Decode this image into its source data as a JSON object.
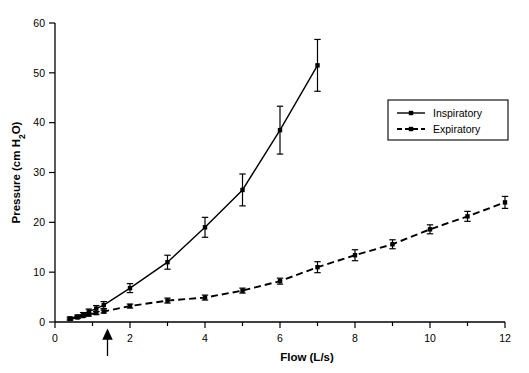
{
  "chart_data": {
    "type": "line",
    "title": "",
    "subtitle": "",
    "xlabel": "Flow (L/s)",
    "ylabel": "Pressure (cm H2O)",
    "ylabel_parts": {
      "pre": "Pressure (cm H",
      "sub": "2",
      "post": "O)"
    },
    "xlim": [
      0,
      12
    ],
    "ylim": [
      0,
      60
    ],
    "xticks": [
      0,
      2,
      4,
      6,
      8,
      10,
      12
    ],
    "xtick_labels": [
      "0",
      "2",
      "4",
      "6",
      "8",
      "10",
      "12"
    ],
    "yticks": [
      0,
      10,
      20,
      30,
      40,
      50,
      60
    ],
    "ytick_labels": [
      "0",
      "10",
      "20",
      "30",
      "40",
      "50",
      "60"
    ],
    "xminor_ticks": [
      1,
      3,
      5,
      7,
      9,
      11
    ],
    "grid": false,
    "legend_position": "upper right",
    "legend_entries": [
      "Inspiratory",
      "Expiratory"
    ],
    "annotations": [
      {
        "name": "flow-marker-arrow",
        "type": "arrow-up",
        "x": 1.4,
        "y": 0,
        "label": ""
      }
    ],
    "series": [
      {
        "name": "Inspiratory",
        "linestyle": "solid",
        "marker": "square",
        "color": "#000000",
        "x": [
          0.4,
          0.6,
          0.75,
          0.9,
          1.1,
          1.3,
          2,
          3,
          4,
          5,
          6,
          7
        ],
        "values": [
          0.7,
          1.1,
          1.5,
          2.1,
          2.7,
          3.4,
          6.8,
          12.0,
          19.0,
          26.5,
          38.5,
          51.5
        ],
        "yerr": [
          0.3,
          0.3,
          0.4,
          0.5,
          0.6,
          0.7,
          0.9,
          1.4,
          2.0,
          3.2,
          4.8,
          5.2
        ]
      },
      {
        "name": "Expiratory",
        "linestyle": "dashed",
        "marker": "square",
        "color": "#000000",
        "x": [
          0.4,
          0.6,
          0.75,
          0.9,
          1.1,
          1.3,
          2,
          3,
          4,
          5,
          6,
          7,
          8,
          9,
          10,
          11,
          12
        ],
        "values": [
          0.6,
          0.9,
          1.2,
          1.5,
          1.8,
          2.1,
          3.2,
          4.3,
          4.9,
          6.3,
          8.2,
          11.0,
          13.4,
          15.6,
          18.6,
          21.2,
          24.0
        ],
        "yerr": [
          0.2,
          0.2,
          0.2,
          0.3,
          0.3,
          0.3,
          0.4,
          0.5,
          0.5,
          0.5,
          0.6,
          1.1,
          1.1,
          0.9,
          0.9,
          1.0,
          1.2
        ]
      }
    ]
  }
}
